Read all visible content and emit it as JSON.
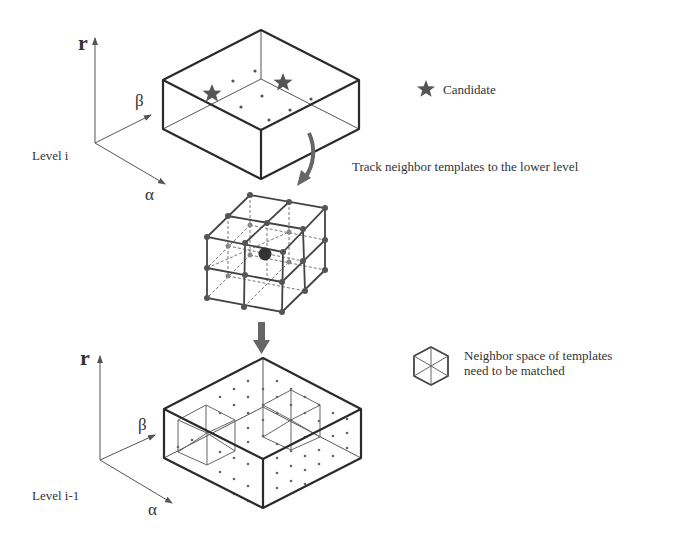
{
  "diagram": {
    "colors": {
      "ink": "#2a2a2a",
      "thin": "#555555",
      "arrow": "#666666",
      "star": "#555555",
      "background": "#ffffff"
    },
    "top_level": {
      "axis_r": "r",
      "axis_beta": "β",
      "axis_alpha": "α",
      "level_label": "Level i"
    },
    "bottom_level": {
      "axis_r": "r",
      "axis_beta": "β",
      "axis_alpha": "α",
      "level_label": "Level i-1"
    },
    "legend": {
      "candidate_icon": "star-icon",
      "candidate_label": "Candidate",
      "neighbor_icon": "cube-icon",
      "neighbor_label_line1": "Neighbor space of templates",
      "neighbor_label_line2": "need to be matched"
    },
    "annotations": {
      "track_label": "Track  neighbor templates to the lower level"
    },
    "nodes": [
      {
        "id": "level-i-box",
        "label": "Level i search space",
        "candidates": 2
      },
      {
        "id": "neighbor-cube",
        "label": "2x2x2 neighbor grid around candidate"
      },
      {
        "id": "level-i-1-box",
        "label": "Level i-1 search space",
        "neighbor_regions": 2
      }
    ],
    "edges": [
      {
        "from": "level-i-box",
        "to": "neighbor-cube",
        "label": "Track  neighbor templates to the lower level"
      },
      {
        "from": "neighbor-cube",
        "to": "level-i-1-box",
        "label": ""
      }
    ]
  }
}
